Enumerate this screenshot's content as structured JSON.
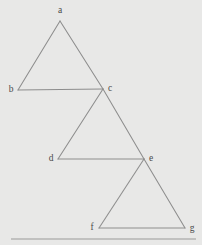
{
  "figure": {
    "background_color": "#e8e8e7",
    "edge_color": "#8d8d8d",
    "label_color": "#4a4a4a",
    "rule_color": "#9a9a9a",
    "width": 202,
    "height": 245
  },
  "chart_data": {
    "type": "diagram",
    "subtype": "triangle-chain-graph",
    "xlabel": "",
    "ylabel": "",
    "xlim": [
      0,
      202
    ],
    "ylim": [
      0,
      245
    ],
    "grid": false,
    "legend": "none",
    "nodes": [
      {
        "id": "a",
        "label": "a",
        "x": 60,
        "y": 21,
        "label_x": 60,
        "label_y": 11,
        "label_anchor": "middle"
      },
      {
        "id": "b",
        "label": "b",
        "x": 18,
        "y": 90,
        "label_x": 11,
        "label_y": 90,
        "label_anchor": "middle"
      },
      {
        "id": "c",
        "label": "c",
        "x": 103,
        "y": 89,
        "label_x": 110,
        "label_y": 89,
        "label_anchor": "middle"
      },
      {
        "id": "d",
        "label": "d",
        "x": 58,
        "y": 159,
        "label_x": 51,
        "label_y": 159,
        "label_anchor": "middle"
      },
      {
        "id": "e",
        "label": "e",
        "x": 144,
        "y": 159,
        "label_x": 151,
        "label_y": 159,
        "label_anchor": "middle"
      },
      {
        "id": "f",
        "label": "f",
        "x": 99,
        "y": 228,
        "label_x": 92,
        "label_y": 228,
        "label_anchor": "middle"
      },
      {
        "id": "g",
        "label": "g",
        "x": 185,
        "y": 228,
        "label_x": 192,
        "label_y": 229,
        "label_anchor": "middle"
      }
    ],
    "edges": [
      {
        "id": "edge-a-b",
        "from": "a",
        "to": "b"
      },
      {
        "id": "edge-a-c",
        "from": "a",
        "to": "c"
      },
      {
        "id": "edge-b-c",
        "from": "b",
        "to": "c"
      },
      {
        "id": "edge-c-d",
        "from": "c",
        "to": "d"
      },
      {
        "id": "edge-c-e",
        "from": "c",
        "to": "e"
      },
      {
        "id": "edge-d-e",
        "from": "d",
        "to": "e"
      },
      {
        "id": "edge-e-f",
        "from": "e",
        "to": "f"
      },
      {
        "id": "edge-e-g",
        "from": "e",
        "to": "g"
      },
      {
        "id": "edge-f-g",
        "from": "f",
        "to": "g"
      }
    ],
    "triangles": [
      {
        "id": "triangle-abc",
        "vertices": [
          "a",
          "b",
          "c"
        ]
      },
      {
        "id": "triangle-cde",
        "vertices": [
          "c",
          "d",
          "e"
        ]
      },
      {
        "id": "triangle-efg",
        "vertices": [
          "e",
          "f",
          "g"
        ]
      }
    ],
    "baseline_rule": {
      "id": "bottom-rule",
      "x1": 11,
      "x2": 196,
      "y": 239
    }
  }
}
